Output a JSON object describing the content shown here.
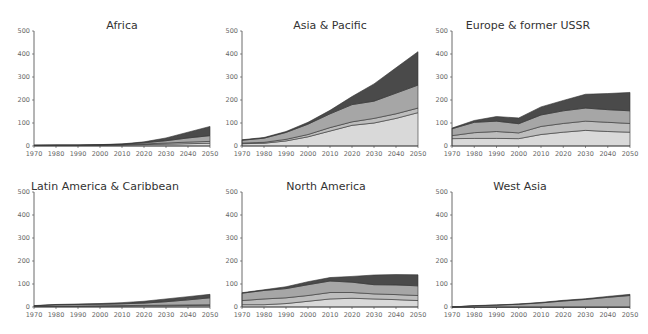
{
  "chart_data": {
    "type": "area",
    "stacked": true,
    "x": [
      1970,
      1980,
      1990,
      2000,
      2010,
      2020,
      2030,
      2040,
      2050
    ],
    "ylim": [
      0,
      500
    ],
    "yticks": [
      0,
      100,
      200,
      300,
      400,
      500
    ],
    "xticks": [
      1970,
      1980,
      1990,
      2000,
      2010,
      2020,
      2030,
      2040,
      2050
    ],
    "colors": [
      "#d9d9d9",
      "#bdbdbd",
      "#a6a6a6",
      "#4a4a4a"
    ],
    "panels": [
      {
        "title": "Africa",
        "series": [
          {
            "name": "layer1",
            "values": [
              2,
              2,
              2,
              3,
              4,
              6,
              8,
              10,
              12
            ]
          },
          {
            "name": "layer2",
            "values": [
              1,
              1,
              1,
              1,
              2,
              3,
              5,
              7,
              8
            ]
          },
          {
            "name": "layer3",
            "values": [
              0,
              1,
              1,
              1,
              2,
              5,
              10,
              18,
              25
            ]
          },
          {
            "name": "layer4",
            "values": [
              0,
              0,
              0,
              1,
              1,
              4,
              12,
              25,
              40
            ]
          }
        ]
      },
      {
        "title": "Asia & Pacific",
        "series": [
          {
            "name": "layer1",
            "values": [
              10,
              12,
              22,
              40,
              65,
              90,
              100,
              120,
              145
            ]
          },
          {
            "name": "layer2",
            "values": [
              3,
              4,
              7,
              10,
              15,
              15,
              20,
              20,
              20
            ]
          },
          {
            "name": "layer3",
            "values": [
              12,
              18,
              30,
              45,
              60,
              75,
              75,
              90,
              100
            ]
          },
          {
            "name": "layer4",
            "values": [
              2,
              3,
              4,
              8,
              15,
              35,
              75,
              110,
              145
            ]
          }
        ]
      },
      {
        "title": "Europe & former USSR",
        "series": [
          {
            "name": "layer1",
            "values": [
              32,
              33,
              33,
              32,
              50,
              60,
              68,
              63,
              60
            ]
          },
          {
            "name": "layer2",
            "values": [
              13,
              25,
              30,
              25,
              35,
              38,
              40,
              40,
              38
            ]
          },
          {
            "name": "layer3",
            "values": [
              30,
              45,
              45,
              40,
              50,
              55,
              57,
              55,
              55
            ]
          },
          {
            "name": "layer4",
            "values": [
              3,
              8,
              20,
              25,
              35,
              45,
              60,
              70,
              80
            ]
          }
        ]
      },
      {
        "title": "Latin America & Caribbean",
        "series": [
          {
            "name": "layer1",
            "values": [
              2,
              3,
              3,
              4,
              4,
              5,
              5,
              6,
              6
            ]
          },
          {
            "name": "layer2",
            "values": [
              1,
              1,
              1,
              1,
              2,
              2,
              3,
              3,
              4
            ]
          },
          {
            "name": "layer3",
            "values": [
              2,
              6,
              7,
              7,
              8,
              10,
              15,
              22,
              30
            ]
          },
          {
            "name": "layer4",
            "values": [
              1,
              1,
              2,
              3,
              5,
              8,
              12,
              14,
              15
            ]
          }
        ]
      },
      {
        "title": "North America",
        "series": [
          {
            "name": "layer1",
            "values": [
              10,
              10,
              15,
              25,
              35,
              38,
              35,
              32,
              28
            ]
          },
          {
            "name": "layer2",
            "values": [
              18,
              25,
              25,
              25,
              28,
              25,
              22,
              22,
              22
            ]
          },
          {
            "name": "layer3",
            "values": [
              32,
              37,
              40,
              47,
              50,
              45,
              40,
              42,
              42
            ]
          },
          {
            "name": "layer4",
            "values": [
              2,
              3,
              8,
              13,
              15,
              25,
              42,
              45,
              48
            ]
          }
        ]
      },
      {
        "title": "West Asia",
        "series": [
          {
            "name": "layer1",
            "values": [
              0,
              0,
              0,
              0,
              0,
              0,
              0,
              0,
              0
            ]
          },
          {
            "name": "layer2",
            "values": [
              0,
              0,
              0,
              0,
              0,
              0,
              0,
              0,
              0
            ]
          },
          {
            "name": "layer3",
            "values": [
              0,
              5,
              8,
              12,
              18,
              26,
              33,
              42,
              50
            ]
          },
          {
            "name": "layer4",
            "values": [
              0,
              1,
              1,
              1,
              2,
              3,
              3,
              4,
              5
            ]
          }
        ]
      }
    ]
  }
}
